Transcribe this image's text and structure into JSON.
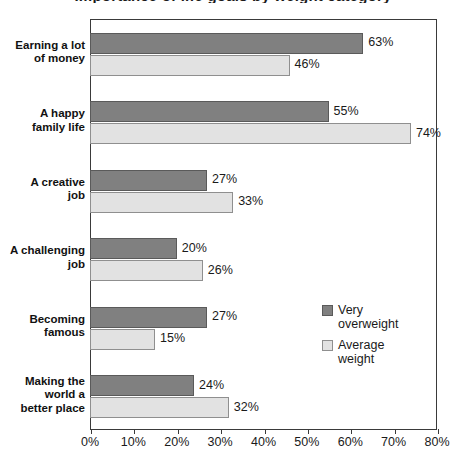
{
  "chart_data": {
    "type": "bar",
    "orientation": "horizontal",
    "title": "Importance of life goals by weight category",
    "xlabel": "",
    "ylabel": "",
    "xlim": [
      0,
      80
    ],
    "xticks": [
      "0%",
      "10%",
      "20%",
      "30%",
      "40%",
      "50%",
      "60%",
      "70%",
      "80%"
    ],
    "xtick_values": [
      0,
      10,
      20,
      30,
      40,
      50,
      60,
      70,
      80
    ],
    "grid": false,
    "legend_position": "inside-right",
    "categories": [
      "Earning a lot of money",
      "A happy family life",
      "A creative job",
      "A challenging job",
      "Becoming famous",
      "Making the world a better place"
    ],
    "category_lines": [
      [
        "Earning a lot",
        "of money"
      ],
      [
        "A happy",
        "family life"
      ],
      [
        "A creative",
        "job"
      ],
      [
        "A challenging",
        "job"
      ],
      [
        "Becoming",
        "famous"
      ],
      [
        "Making the",
        "world a",
        "better place"
      ]
    ],
    "series": [
      {
        "name": "Very overweight",
        "color": "#808080",
        "values": [
          63,
          55,
          27,
          20,
          27,
          24
        ],
        "labels": [
          "63%",
          "55%",
          "27%",
          "20%",
          "27%",
          "24%"
        ]
      },
      {
        "name": "Average weight",
        "color": "#e2e2e2",
        "values": [
          46,
          74,
          33,
          26,
          15,
          32
        ],
        "labels": [
          "46%",
          "74%",
          "33%",
          "26%",
          "15%",
          "32%"
        ]
      }
    ]
  },
  "legend": {
    "items": [
      {
        "label_line1": "Very",
        "label_line2": "overweight"
      },
      {
        "label_line1": "Average",
        "label_line2": "weight"
      }
    ]
  }
}
